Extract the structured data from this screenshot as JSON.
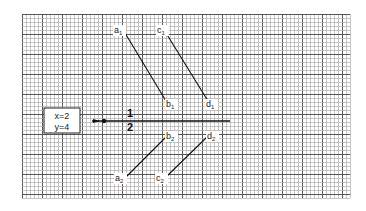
{
  "grid": {
    "x0": 22,
    "y0": 14,
    "x1": 350,
    "y1": 198,
    "minor": 4,
    "major": 20,
    "minor_color": "#b5b5b5",
    "major_color": "#555555"
  },
  "info_box": {
    "line1": "x=2",
    "line2": "y=4"
  },
  "axis": {
    "fraction_numerator": "1",
    "fraction_denominator": "2"
  },
  "segments": [
    {
      "start": "a",
      "start_sub": "1",
      "end": "b",
      "end_sub": "1"
    },
    {
      "start": "c",
      "start_sub": "1",
      "end": "d",
      "end_sub": "1"
    },
    {
      "start": "a",
      "start_sub": "2",
      "end": "b",
      "end_sub": "2"
    },
    {
      "start": "c",
      "start_sub": "2",
      "end": "d",
      "end_sub": "2"
    }
  ]
}
